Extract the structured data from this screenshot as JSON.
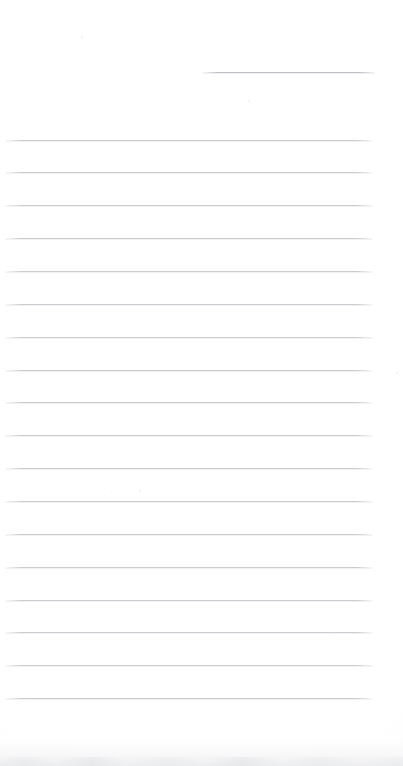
{
  "document": {
    "kind": "scanned-blank-lined-page",
    "page_width": 403,
    "page_height": 766,
    "page_background_color": "#ffffff",
    "visible_text": "",
    "text_content_present": false
  },
  "ruling": {
    "line_color": "#c6c8cb",
    "short_line_color": "#b9bcc0",
    "line_thickness_px": 1,
    "line_spacing_px": 32.6,
    "full_line_left_px": 5,
    "full_line_right_px": 372,
    "full_line_count": 18,
    "short_line_count": 1
  },
  "lines": [
    {
      "id": "rule-short-1",
      "type": "short",
      "y": 72,
      "x1": 202,
      "x2": 375
    },
    {
      "id": "rule-1",
      "type": "full",
      "y": 140,
      "x1": 5,
      "x2": 372
    },
    {
      "id": "rule-2",
      "type": "full",
      "y": 172,
      "x1": 5,
      "x2": 372
    },
    {
      "id": "rule-3",
      "type": "full",
      "y": 205,
      "x1": 5,
      "x2": 372
    },
    {
      "id": "rule-4",
      "type": "full",
      "y": 238,
      "x1": 5,
      "x2": 372
    },
    {
      "id": "rule-5",
      "type": "full",
      "y": 271,
      "x1": 5,
      "x2": 372
    },
    {
      "id": "rule-6",
      "type": "full",
      "y": 304,
      "x1": 5,
      "x2": 372
    },
    {
      "id": "rule-7",
      "type": "full",
      "y": 337,
      "x1": 5,
      "x2": 372
    },
    {
      "id": "rule-8",
      "type": "full",
      "y": 370,
      "x1": 5,
      "x2": 372
    },
    {
      "id": "rule-9",
      "type": "full",
      "y": 402,
      "x1": 5,
      "x2": 372
    },
    {
      "id": "rule-10",
      "type": "full",
      "y": 435,
      "x1": 5,
      "x2": 372
    },
    {
      "id": "rule-11",
      "type": "full",
      "y": 468,
      "x1": 5,
      "x2": 372
    },
    {
      "id": "rule-12",
      "type": "full",
      "y": 501,
      "x1": 5,
      "x2": 372
    },
    {
      "id": "rule-13",
      "type": "full",
      "y": 534,
      "x1": 5,
      "x2": 372
    },
    {
      "id": "rule-14",
      "type": "full",
      "y": 567,
      "x1": 5,
      "x2": 372
    },
    {
      "id": "rule-15",
      "type": "full",
      "y": 600,
      "x1": 5,
      "x2": 372
    },
    {
      "id": "rule-16",
      "type": "full",
      "y": 632,
      "x1": 5,
      "x2": 372
    },
    {
      "id": "rule-17",
      "type": "full",
      "y": 665,
      "x1": 5,
      "x2": 372
    },
    {
      "id": "rule-18",
      "type": "full",
      "y": 698,
      "x1": 5,
      "x2": 372
    }
  ],
  "artifacts": {
    "bottom_edge_shadow": {
      "present": true,
      "y": 740,
      "height": 26,
      "color": "#e9eaec"
    },
    "specks": [
      {
        "x": 81,
        "y": 36,
        "size": 2
      },
      {
        "x": 248,
        "y": 100,
        "size": 2
      },
      {
        "x": 237,
        "y": 103,
        "size": 1
      },
      {
        "x": 238,
        "y": 57,
        "size": 1
      },
      {
        "x": 139,
        "y": 490,
        "size": 2
      },
      {
        "x": 111,
        "y": 492,
        "size": 1
      },
      {
        "x": 28,
        "y": 453,
        "size": 1
      },
      {
        "x": 396,
        "y": 372,
        "size": 2
      },
      {
        "x": 198,
        "y": 741,
        "size": 1
      },
      {
        "x": 330,
        "y": 635,
        "size": 1
      }
    ]
  }
}
